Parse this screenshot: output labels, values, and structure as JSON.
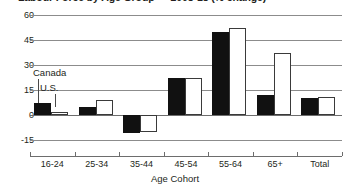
{
  "chart_data": {
    "type": "bar",
    "title": "Labour Force by Age Group — 2008-18 (% change)",
    "xlabel": "Age Cohort",
    "ylabel": "",
    "categories": [
      "16-24",
      "25-34",
      "35-44",
      "45-54",
      "55-64",
      "65+",
      "Total"
    ],
    "series": [
      {
        "name": "Canada",
        "color": "#111111",
        "values": [
          7,
          5,
          -11,
          22,
          50,
          12,
          10
        ]
      },
      {
        "name": "U.S.",
        "color": "#ffffff",
        "values": [
          2,
          9,
          -10,
          22,
          52,
          37,
          11
        ]
      }
    ],
    "ylim": [
      -15,
      60
    ],
    "yticks": [
      60,
      45,
      30,
      15,
      0,
      -15
    ],
    "ytick_labels": [
      "60",
      "45",
      "30",
      "15",
      "0",
      "-15"
    ],
    "grid": true,
    "legend_position": "callout-inside-plot",
    "annotations": [
      {
        "text": "Canada",
        "target_series": "Canada",
        "target_category": "16-24"
      },
      {
        "text": "U.S.",
        "target_series": "U.S.",
        "target_category": "16-24"
      }
    ]
  },
  "axis": {
    "y_tick_0": "60",
    "y_tick_1": "45",
    "y_tick_2": "30",
    "y_tick_3": "15",
    "y_tick_4": "0",
    "y_tick_5": "-15"
  },
  "legend": {
    "canada_label": "Canada",
    "us_label": "U.S."
  }
}
